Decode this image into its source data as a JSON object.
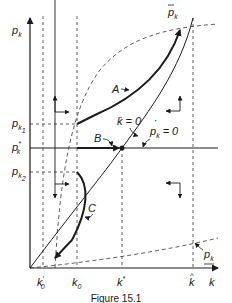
{
  "figure": {
    "caption": "Figure 15.1",
    "axes": {
      "y_label": "p",
      "y_label_sub": "k",
      "x_label": "k"
    },
    "x_ticks": [
      {
        "id": "k0-prime",
        "main": "k",
        "sub": "0",
        "prime": "′"
      },
      {
        "id": "k0",
        "main": "k",
        "sub": "0"
      },
      {
        "id": "k-star",
        "main": "k",
        "sup": "*"
      },
      {
        "id": "k-hat",
        "main": "k",
        "hat": "^"
      }
    ],
    "y_ticks": [
      {
        "id": "pk1",
        "main": "p",
        "sub": "k",
        "subsub": "1"
      },
      {
        "id": "pk-star",
        "main": "p",
        "sub": "k",
        "sup": "*"
      },
      {
        "id": "pk2",
        "main": "p",
        "sub": "k",
        "subsub": "2"
      }
    ],
    "curves": {
      "p_bar_k": {
        "main": "p",
        "sub": "k",
        "bar": "‾"
      },
      "k_dot_zero": "k̇ = 0",
      "p_dot_k_zero": {
        "main": "p",
        "sub": "k",
        "dot": "˙",
        "eq": "= 0"
      },
      "p_underbar_k": {
        "main": "p",
        "sub": "k"
      }
    },
    "paths": {
      "A": "A",
      "B": "B",
      "C": "C"
    }
  }
}
